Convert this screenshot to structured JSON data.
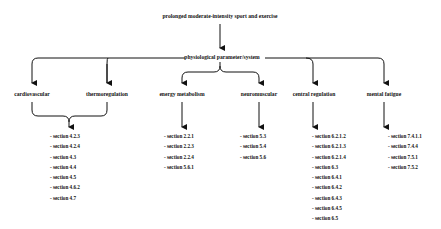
{
  "title": "prolonged moderate-intensity sport and exercise",
  "center": "physiological parameter/system",
  "categories": [
    {
      "label": "cardiovascular"
    },
    {
      "label": "thermoregulation"
    },
    {
      "label": "energy metabolism"
    },
    {
      "label": "neuromuscular"
    },
    {
      "label": "central regulation"
    },
    {
      "label": "mental fatigue"
    }
  ],
  "lists": {
    "cardio_thermo": [
      "- section 4.2.3",
      "- section 4.2.4",
      "- section 4.3",
      "- section 4.4",
      "- section 4.5",
      "- section 4.6.2",
      "- section 4.7"
    ],
    "energy": [
      "- section 2.2.1",
      "- section 2.2.3",
      "- section 2.2.4",
      "- section 5.6.1"
    ],
    "neuro": [
      "- section 5.3",
      "- section 5.4",
      "- section 5.6"
    ],
    "central": [
      "- section 6.2.1.2",
      "- section 6.2.1.3",
      "- section 6.2.1.4",
      "- section 6.3",
      "- section 6.4.1",
      "- section 6.4.2",
      "- section 6.4.3",
      "- section 6.4.5",
      "- section 6.5"
    ],
    "mental": [
      "- section 7.4.1.1",
      "- section 7.4.4",
      "- section 7.5.1",
      "- section 7.5.2"
    ]
  }
}
